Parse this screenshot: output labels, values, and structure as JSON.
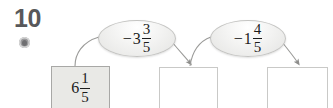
{
  "problem": {
    "number": "10",
    "icon": "audio-speaker-icon"
  },
  "flow": {
    "start_box": {
      "label": "start-value",
      "whole": "6",
      "numerator": "1",
      "denominator": "5",
      "fill_color": "#e9e9e6"
    },
    "operations": [
      {
        "label": "subtract-three-and-three-fifths",
        "sign": "−",
        "whole": "3",
        "numerator": "3",
        "denominator": "5"
      },
      {
        "label": "subtract-one-and-four-fifths",
        "sign": "−",
        "whole": "1",
        "numerator": "4",
        "denominator": "5"
      }
    ],
    "answer_boxes": [
      {
        "label": "answer-box-1",
        "value": ""
      },
      {
        "label": "answer-box-2",
        "value": ""
      }
    ]
  },
  "colors": {
    "number_gray": "#58585a",
    "oval_border": "#c4c4c2",
    "arrow_stroke": "#9b9b99",
    "box_border": "#c9c9c7"
  }
}
